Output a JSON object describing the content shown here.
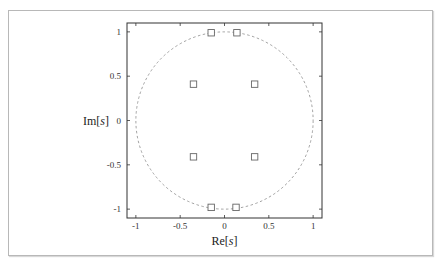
{
  "chart_data": {
    "type": "scatter",
    "title": "",
    "xlabel": "Re[s]",
    "ylabel": "Im[s]",
    "xlabel_parts": {
      "pre": "Re[",
      "var": "s",
      "post": "]"
    },
    "ylabel_parts": {
      "pre": "Im[",
      "var": "s",
      "post": "]"
    },
    "xlim": [
      -1.1,
      1.1
    ],
    "ylim": [
      -1.1,
      1.1
    ],
    "x_ticks": [
      -1,
      -0.5,
      0,
      0.5,
      1
    ],
    "y_ticks": [
      -1,
      -0.5,
      0,
      0.5,
      1
    ],
    "x_tick_labels": [
      "-1",
      "-0.5",
      "0",
      "0.5",
      "1"
    ],
    "y_tick_labels": [
      "-1",
      "-0.5",
      "0",
      "0.5",
      "1"
    ],
    "grid": false,
    "legend": null,
    "series": [
      {
        "name": "poles",
        "marker": "square-open",
        "x": [
          -0.15,
          0.14,
          -0.35,
          0.34,
          -0.35,
          0.34,
          -0.15,
          0.13
        ],
        "y": [
          0.99,
          0.99,
          0.41,
          0.41,
          -0.41,
          -0.41,
          -0.98,
          -0.98
        ]
      }
    ],
    "annotations": [
      {
        "type": "circle",
        "center": [
          0,
          0
        ],
        "radius": 1,
        "style": "dashed",
        "label": "unit circle"
      }
    ]
  },
  "colors": {
    "frame": "#333333",
    "circle": "#8a8a8a",
    "marker": "#666666",
    "card_border": "#b8b8b8"
  }
}
